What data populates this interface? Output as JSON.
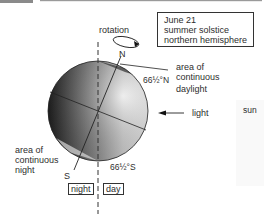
{
  "info_box": {
    "lines": [
      "June 21",
      "summer solstice",
      "northern hemisphere"
    ]
  },
  "labels": {
    "rotation": "rotation",
    "north": "N",
    "south": "S",
    "north_latitude": "66½°N",
    "south_latitude": "66½°S",
    "continuous_daylight": [
      "area of",
      "continuous",
      "daylight"
    ],
    "continuous_night": [
      "area of",
      "continuous",
      "night"
    ],
    "light": "light",
    "sun": "sun",
    "night": "night",
    "day": "day"
  },
  "colors": {
    "globe_dark": "#2b2b2b",
    "globe_light": "#f2f2f2",
    "line": "#222222",
    "header_bar": "#8a8a8a"
  }
}
